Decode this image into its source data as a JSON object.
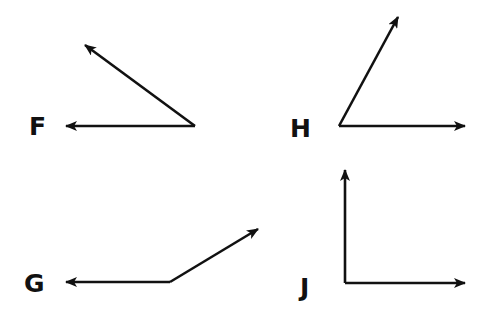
{
  "diagram": {
    "type": "angles",
    "stroke_color": "#111111",
    "background": "#ffffff",
    "angles": [
      {
        "label": "F",
        "vertex": [
          195,
          126
        ],
        "rays": [
          [
            66,
            126
          ],
          [
            85,
            45
          ]
        ],
        "kind": "acute"
      },
      {
        "label": "H",
        "vertex": [
          339,
          126
        ],
        "rays": [
          [
            465,
            126
          ],
          [
            398,
            17
          ]
        ],
        "kind": "acute"
      },
      {
        "label": "G",
        "vertex": [
          170,
          282
        ],
        "rays": [
          [
            66,
            282
          ],
          [
            258,
            229
          ]
        ],
        "kind": "obtuse"
      },
      {
        "label": "J",
        "vertex": [
          345,
          283
        ],
        "rays": [
          [
            465,
            283
          ],
          [
            345,
            170
          ]
        ],
        "kind": "right"
      }
    ]
  },
  "labels": {
    "F": "F",
    "H": "H",
    "G": "G",
    "J": "J"
  }
}
